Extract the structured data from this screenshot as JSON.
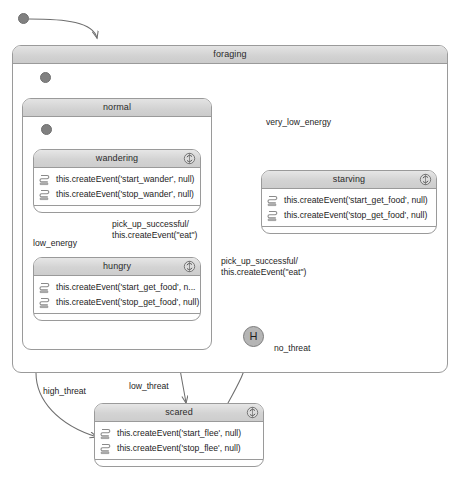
{
  "diagram": {
    "type": "uml-state-machine",
    "width": 460,
    "height": 485,
    "colors": {
      "background": "#ffffff",
      "state_border": "#9a9a9a",
      "title_fill": "#d3d3d3",
      "edge_stroke": "#6e6e6e",
      "pseudostate_fill": "#808080",
      "history_fill": "#b5b5b5",
      "text": "#1d1d1d"
    }
  },
  "states": {
    "foraging": {
      "name": "foraging",
      "kind": "composite"
    },
    "normal": {
      "name": "normal",
      "kind": "composite"
    },
    "wandering": {
      "name": "wandering",
      "kind": "simple",
      "do_activity_icon": "cycle-icon",
      "actions": [
        "this.createEvent('start_wander', null)",
        "this.createEvent('stop_wander', null)"
      ]
    },
    "hungry": {
      "name": "hungry",
      "kind": "simple",
      "do_activity_icon": "cycle-icon",
      "actions": [
        "this.createEvent('start_get_food', n...",
        "this.createEvent('stop_get_food', null)"
      ]
    },
    "starving": {
      "name": "starving",
      "kind": "simple",
      "do_activity_icon": "cycle-icon",
      "actions": [
        "this.createEvent('start_get_food', null)",
        "this.createEvent('stop_get_food', null)"
      ]
    },
    "scared": {
      "name": "scared",
      "kind": "simple",
      "do_activity_icon": "cycle-icon",
      "actions": [
        "this.createEvent('start_flee', null)",
        "this.createEvent('stop_flee', null)"
      ]
    }
  },
  "pseudostates": {
    "initial_top": {
      "kind": "initial"
    },
    "initial_foraging": {
      "kind": "initial"
    },
    "initial_normal": {
      "kind": "initial"
    },
    "history": {
      "kind": "shallow-history",
      "label": "H"
    }
  },
  "transitions": [
    {
      "id": "t_init_foraging",
      "from": "initial_top",
      "to": "foraging",
      "label": ""
    },
    {
      "id": "t_init_normal",
      "from": "initial_foraging",
      "to": "normal",
      "label": ""
    },
    {
      "id": "t_init_wandering",
      "from": "initial_normal",
      "to": "wandering",
      "label": ""
    },
    {
      "id": "t_very_low",
      "from": "normal",
      "to": "starving",
      "label": "very_low_energy"
    },
    {
      "id": "t_low_energy",
      "from": "wandering",
      "to": "hungry",
      "label": "low_energy"
    },
    {
      "id": "t_pick_up_hungry",
      "from": "hungry",
      "to": "wandering",
      "label": "pick_up_successful/\nthis.createEvent(\"eat\")"
    },
    {
      "id": "t_pick_up_starve",
      "from": "starving",
      "to": "normal",
      "label": "pick_up_successful/\nthis.createEvent(\"eat\")"
    },
    {
      "id": "t_high_threat",
      "from": "foraging",
      "to": "scared",
      "label": "high_threat"
    },
    {
      "id": "t_low_threat",
      "from": "normal",
      "to": "scared",
      "label": "low_threat"
    },
    {
      "id": "t_no_threat",
      "from": "scared",
      "to": "history",
      "label": "no_threat"
    }
  ],
  "labels": {
    "very_low_energy": "very_low_energy",
    "low_energy": "low_energy",
    "pick_up_1_line1": "pick_up_successful/",
    "pick_up_1_line2": "this.createEvent(\"eat\")",
    "pick_up_2_line1": "pick_up_successful/",
    "pick_up_2_line2": "this.createEvent(\"eat\")",
    "high_threat": "high_threat",
    "low_threat": "low_threat",
    "no_threat": "no_threat",
    "history_label": "H"
  }
}
